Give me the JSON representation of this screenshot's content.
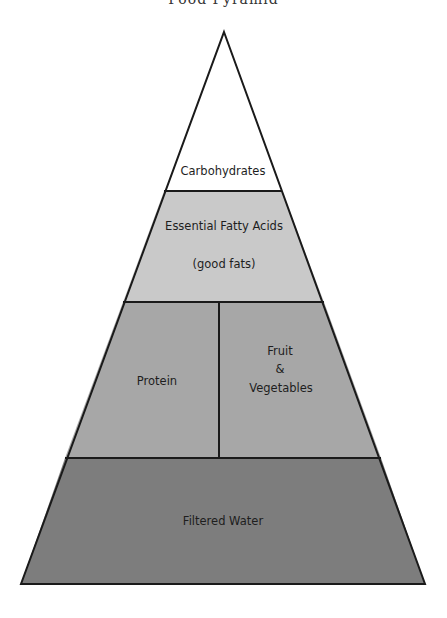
{
  "title": "Food Pyramid",
  "levels": [
    {
      "id": "carbohydrates",
      "label": "Carbohydrates",
      "fill": "#ffffff"
    },
    {
      "id": "fatty-acids",
      "label": "Essential Fatty Acids",
      "sublabel": "(good fats)",
      "fill": "#c9c9c9"
    },
    {
      "id": "protein",
      "label": "Protein",
      "fill": "#a7a7a7"
    },
    {
      "id": "fruit-veg",
      "label_lines": [
        "Fruit",
        "&",
        "Vegetables"
      ],
      "fill": "#a7a7a7"
    },
    {
      "id": "water",
      "label": "Filtered Water",
      "fill": "#7d7d7d"
    }
  ],
  "colors": {
    "outline": "#1a1a1a",
    "text": "#1e1e1e"
  }
}
